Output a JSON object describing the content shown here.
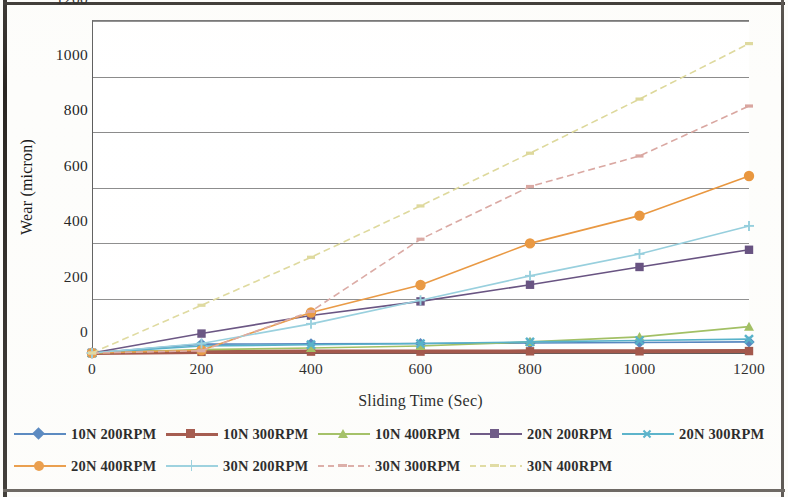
{
  "chart_data": {
    "type": "line",
    "title": "",
    "xlabel": "Sliding Time (Sec)",
    "ylabel": "Wear (micron)",
    "x": [
      0,
      200,
      400,
      600,
      800,
      1000,
      1200
    ],
    "xlim": [
      0,
      1200
    ],
    "ylim": [
      0,
      1200
    ],
    "xticks": [
      "0",
      "200",
      "400",
      "600",
      "800",
      "1000",
      "1200"
    ],
    "yticks": [
      "0",
      "200",
      "400",
      "600",
      "800",
      "1000",
      "1200"
    ],
    "grid": "horizontal",
    "legend_position": "bottom",
    "series": [
      {
        "name": "10N 200RPM",
        "color": "#4A7EBB",
        "marker": "diamond",
        "dash": "solid",
        "values": [
          0,
          32,
          33,
          34,
          36,
          38,
          40
        ]
      },
      {
        "name": "10N 300RPM",
        "color": "#9C4B3E",
        "marker": "square",
        "dash": "solid",
        "values": [
          0,
          4,
          5,
          5,
          6,
          6,
          7
        ]
      },
      {
        "name": "10N 400RPM",
        "color": "#9BBB59",
        "marker": "triangle",
        "dash": "solid",
        "values": [
          0,
          12,
          18,
          25,
          40,
          58,
          95
        ]
      },
      {
        "name": "20N 200RPM",
        "color": "#604A7B",
        "marker": "square",
        "dash": "solid",
        "values": [
          0,
          70,
          135,
          186,
          246,
          310,
          372
        ]
      },
      {
        "name": "20N 300RPM",
        "color": "#4BACC6",
        "marker": "x",
        "dash": "solid",
        "values": [
          0,
          25,
          30,
          34,
          40,
          45,
          50
        ]
      },
      {
        "name": "20N 400RPM",
        "color": "#E8943A",
        "marker": "circle",
        "dash": "solid",
        "values": [
          0,
          10,
          146,
          245,
          395,
          495,
          638
        ]
      },
      {
        "name": "30N 200RPM",
        "color": "#92CDDC",
        "marker": "plus",
        "dash": "solid",
        "values": [
          0,
          34,
          105,
          190,
          278,
          357,
          458
        ]
      },
      {
        "name": "30N 300RPM",
        "color": "#D9A6A0",
        "marker": "dash",
        "dash": "dashed",
        "values": [
          0,
          8,
          150,
          410,
          600,
          710,
          890
        ]
      },
      {
        "name": "30N 400RPM",
        "color": "#DDD89A",
        "marker": "dash",
        "dash": "dashed",
        "values": [
          0,
          172,
          345,
          530,
          720,
          915,
          1115
        ]
      }
    ]
  },
  "legend": {
    "row1": [
      "10N 200RPM",
      "10N 300RPM",
      "10N 400RPM",
      "20N 200RPM",
      "20N 300RPM"
    ],
    "row2": [
      "20N 400RPM",
      "30N 200RPM",
      "30N 300RPM",
      "30N 400RPM"
    ]
  }
}
